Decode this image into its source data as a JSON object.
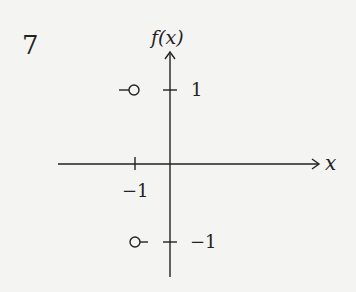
{
  "question_number": "7",
  "graph": {
    "y_axis_label": "f(x)",
    "x_axis_label": "x",
    "y_ticks": [
      {
        "value": 1,
        "label": "1"
      },
      {
        "value": -1,
        "label": "−1"
      }
    ],
    "x_ticks": [
      {
        "value": -1,
        "label": "−1"
      }
    ],
    "features": [
      {
        "type": "open-circle",
        "x": -1,
        "y": 1,
        "direction": "approached from left"
      },
      {
        "type": "open-circle",
        "x": -1,
        "y": -1,
        "direction": "approached from right"
      }
    ],
    "colors": {
      "ink": "#222222",
      "background": "#f4f4f2"
    }
  }
}
